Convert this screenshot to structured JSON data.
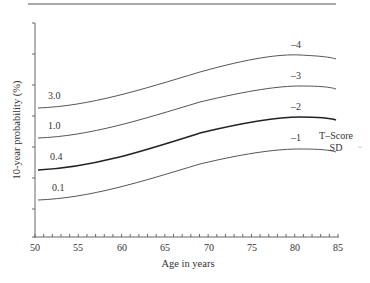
{
  "chart_data": {
    "type": "line",
    "title": "",
    "xlabel": "Age in years",
    "ylabel": "10-year probability (%)",
    "xlim": [
      50,
      85
    ],
    "x_ticks": [
      50,
      55,
      60,
      65,
      70,
      75,
      80,
      85
    ],
    "y_ticks_labeled": false,
    "grid": false,
    "legend_title": [
      "T–Score",
      "SD"
    ],
    "x": [
      50,
      55,
      60,
      65,
      70,
      75,
      80,
      85
    ],
    "series": [
      {
        "name": "-4",
        "left_label": "3.0",
        "values": [
          108,
          103,
          93,
          81,
          69,
          60,
          55,
          59
        ],
        "units": "px_from_top_estimate"
      },
      {
        "name": "-3",
        "left_label": "1.0",
        "values": [
          138,
          133,
          123,
          111,
          99,
          90,
          86,
          89
        ],
        "units": "px_from_top_estimate"
      },
      {
        "name": "-2",
        "left_label": "0.4",
        "values": [
          170,
          164,
          154,
          142,
          130,
          121,
          117,
          120
        ],
        "units": "px_from_top_estimate",
        "bold": true
      },
      {
        "name": "-1",
        "left_label": "0.1",
        "values": [
          200,
          195,
          185,
          173,
          161,
          152,
          149,
          152
        ],
        "units": "px_from_top_estimate"
      }
    ]
  },
  "labels": {
    "xlabel": "Age in years",
    "ylabel": "10-year probability (%)",
    "ticks": [
      "50",
      "55",
      "60",
      "65",
      "70",
      "75",
      "80",
      "85"
    ],
    "legend_line1": "T–Score",
    "legend_line2": "SD",
    "series_right": [
      "–4",
      "–3",
      "–2",
      "–1"
    ],
    "series_left": [
      "3.0",
      "1.0",
      "0.4",
      "0.1"
    ]
  }
}
